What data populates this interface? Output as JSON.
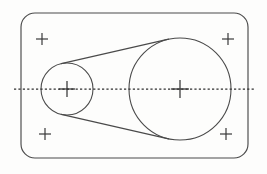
{
  "drawing": {
    "title": "Belt and pulley mechanical outline drawing",
    "canvas": {
      "width": 267,
      "height": 174,
      "background_color": "#fdfdfc"
    },
    "stroke_color": "#4a4a4a",
    "centerline_color": "#2e2e2e",
    "plate": {
      "label": "rounded-rectangle-plate",
      "x": 21,
      "y": 13,
      "width": 227,
      "height": 145,
      "corner_radius": 14,
      "stroke_width": 1.15
    },
    "pulleys": [
      {
        "label": "small-pulley",
        "cx": 67,
        "cy": 89,
        "r": 26
      },
      {
        "label": "large-pulley",
        "cx": 180,
        "cy": 89,
        "r": 51
      }
    ],
    "belt": {
      "label": "external-tangent-belt",
      "upper_tangent": {
        "x1": 61.3,
        "y1": 63.6,
        "x2": 168.6,
        "y2": 39.1
      },
      "lower_tangent": {
        "x1": 61.3,
        "y1": 114.4,
        "x2": 168.6,
        "y2": 138.9
      }
    },
    "centerline": {
      "label": "horizontal-axis-centerline",
      "y": 89,
      "x_start": 14,
      "x_end": 256,
      "dash_pattern": "2.2 2.2"
    },
    "crosses": [
      {
        "label": "cross-top-left",
        "cx": 42,
        "cy": 39,
        "arm": 6
      },
      {
        "label": "cross-top-right",
        "cx": 228,
        "cy": 39,
        "arm": 6
      },
      {
        "label": "cross-bottom-left",
        "cx": 45,
        "cy": 134,
        "arm": 6
      },
      {
        "label": "cross-bottom-right",
        "cx": 226,
        "cy": 134,
        "arm": 6
      },
      {
        "label": "cross-center-small",
        "cx": 67,
        "cy": 89,
        "arm": 8
      },
      {
        "label": "cross-center-large",
        "cx": 180,
        "cy": 89,
        "arm": 9
      }
    ]
  }
}
